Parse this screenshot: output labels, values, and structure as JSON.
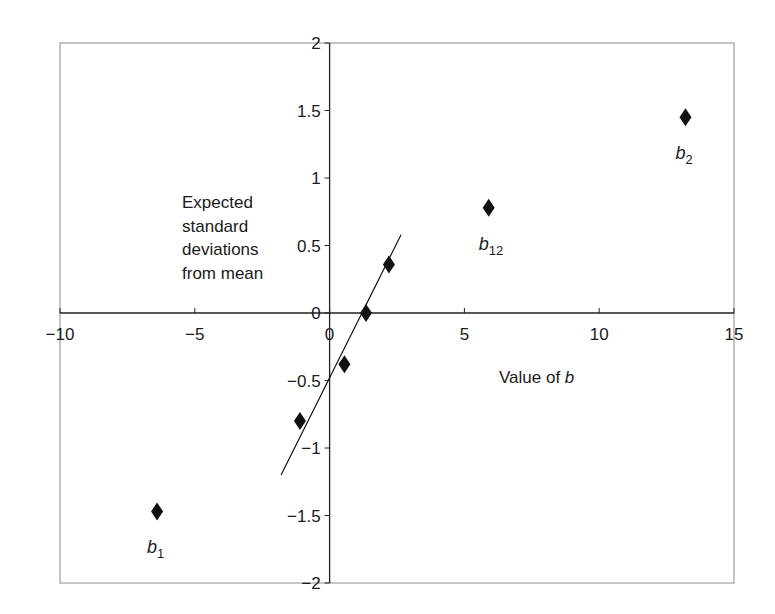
{
  "chart_data": {
    "type": "scatter",
    "title": "",
    "xlabel": "Value of b",
    "xlabel_prefix": "Value of ",
    "xlabel_var": "b",
    "ylabel": "Expected standard deviations from mean",
    "ylabel_lines": [
      "Expected",
      "standard",
      "deviations",
      "from mean"
    ],
    "xlim": [
      -10,
      15
    ],
    "ylim": [
      -2,
      2
    ],
    "x_ticks": [
      -10,
      -5,
      0,
      5,
      10,
      15
    ],
    "x_tick_labels": [
      "−10",
      "−5",
      "0",
      "5",
      "10",
      "15"
    ],
    "y_ticks": [
      -2,
      -1.5,
      -1,
      -0.5,
      0,
      0.5,
      1,
      1.5,
      2
    ],
    "y_tick_labels": [
      "−2",
      "−1.5",
      "−1",
      "−0.5",
      "0",
      "0.5",
      "1",
      "1.5",
      "2"
    ],
    "grid": false,
    "legend": null,
    "series": [
      {
        "name": "effects",
        "marker": "diamond",
        "color": "#111111",
        "points": [
          {
            "x": -6.4,
            "y": -1.47,
            "label": "b",
            "sub": "1"
          },
          {
            "x": -1.1,
            "y": -0.8,
            "label": "",
            "sub": ""
          },
          {
            "x": 0.55,
            "y": -0.38,
            "label": "",
            "sub": ""
          },
          {
            "x": 1.35,
            "y": 0.0,
            "label": "",
            "sub": ""
          },
          {
            "x": 2.2,
            "y": 0.36,
            "label": "",
            "sub": ""
          },
          {
            "x": 5.9,
            "y": 0.78,
            "label": "b",
            "sub": "12"
          },
          {
            "x": 13.2,
            "y": 1.45,
            "label": "b",
            "sub": "2"
          }
        ]
      }
    ],
    "reference_line": {
      "type": "line",
      "color": "#111111",
      "x": [
        -1.8,
        2.65
      ],
      "y": [
        -1.2,
        0.58
      ]
    }
  }
}
